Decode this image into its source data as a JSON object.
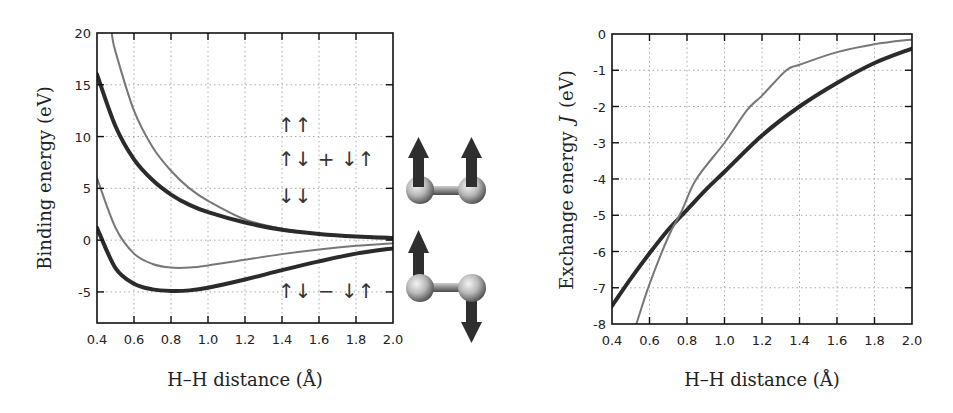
{
  "colors": {
    "thick_curve": "#2b2b2b",
    "thin_curve": "#777777",
    "grid": "#aaaaaa",
    "axis": "#111111",
    "arrow": "#2e2e2e",
    "atom": "#bdbdbd"
  },
  "chart_data": [
    {
      "type": "line",
      "title": "",
      "xlabel": "H–H distance (Å)",
      "ylabel": "Binding energy (eV)",
      "xlim": [
        0.4,
        2.0
      ],
      "ylim": [
        -8,
        20
      ],
      "grid": true,
      "x_ticks": [
        "0.4",
        "0.6",
        "0.8",
        "1.0",
        "1.2",
        "1.4",
        "1.6",
        "1.8",
        "2.0"
      ],
      "y_ticks": [
        "20",
        "15",
        "10",
        "5",
        "0",
        "-5"
      ],
      "annotations": [
        "↑↑",
        "↑↓ + ↓↑",
        "↓↓",
        "↑↓ − ↓↑"
      ],
      "series": [
        {
          "name": "triplet (thin)",
          "style": "thin",
          "x": [
            0.48,
            0.5,
            0.6,
            0.7,
            0.8,
            0.9,
            1.0,
            1.2,
            1.4,
            1.6,
            1.8,
            2.0
          ],
          "y": [
            20,
            18.2,
            12.5,
            9.0,
            6.7,
            5.0,
            3.8,
            2.0,
            1.1,
            0.6,
            0.4,
            0.3
          ]
        },
        {
          "name": "triplet (thick)",
          "style": "thick",
          "x": [
            0.4,
            0.5,
            0.6,
            0.7,
            0.8,
            0.9,
            1.0,
            1.2,
            1.4,
            1.6,
            1.8,
            2.0
          ],
          "y": [
            16,
            11,
            7.8,
            5.8,
            4.4,
            3.4,
            2.7,
            1.7,
            1.0,
            0.6,
            0.35,
            0.2
          ]
        },
        {
          "name": "singlet (thin)",
          "style": "thin",
          "x": [
            0.4,
            0.5,
            0.6,
            0.7,
            0.8,
            0.9,
            1.0,
            1.2,
            1.4,
            1.6,
            1.8,
            2.0
          ],
          "y": [
            6,
            1.2,
            -1.3,
            -2.3,
            -2.65,
            -2.65,
            -2.45,
            -1.9,
            -1.35,
            -0.9,
            -0.55,
            -0.3
          ]
        },
        {
          "name": "singlet (thick)",
          "style": "thick",
          "x": [
            0.4,
            0.5,
            0.6,
            0.7,
            0.8,
            0.9,
            1.0,
            1.2,
            1.4,
            1.6,
            1.8,
            2.0
          ],
          "y": [
            1.2,
            -2.7,
            -4.2,
            -4.75,
            -4.9,
            -4.85,
            -4.6,
            -3.8,
            -2.9,
            -2.05,
            -1.3,
            -0.8
          ]
        }
      ]
    },
    {
      "type": "line",
      "title": "",
      "xlabel": "H–H distance (Å)",
      "ylabel": "Exchange energy  J  (eV)",
      "xlim": [
        0.4,
        2.0
      ],
      "ylim": [
        -8,
        0
      ],
      "grid": true,
      "x_ticks": [
        "0.4",
        "0.6",
        "0.8",
        "1.0",
        "1.2",
        "1.4",
        "1.6",
        "1.8",
        "2.0"
      ],
      "y_ticks": [
        "0",
        "-1",
        "-2",
        "-3",
        "-4",
        "-5",
        "-6",
        "-7",
        "-8"
      ],
      "series": [
        {
          "name": "J (thick)",
          "style": "thick",
          "x": [
            0.4,
            0.5,
            0.6,
            0.7,
            0.8,
            0.9,
            1.0,
            1.2,
            1.4,
            1.6,
            1.8,
            2.0
          ],
          "y": [
            -7.5,
            -6.75,
            -6.05,
            -5.4,
            -4.85,
            -4.3,
            -3.8,
            -2.8,
            -2.0,
            -1.35,
            -0.8,
            -0.4
          ]
        },
        {
          "name": "J (thin)",
          "style": "thin",
          "x": [
            0.53,
            0.6,
            0.7,
            0.77,
            0.85,
            1.0,
            1.12,
            1.2,
            1.33,
            1.4,
            1.6,
            1.8,
            2.0
          ],
          "y": [
            -8,
            -6.9,
            -5.6,
            -4.9,
            -4.0,
            -3.0,
            -2.1,
            -1.7,
            -1.0,
            -0.85,
            -0.5,
            -0.28,
            -0.15
          ]
        }
      ]
    }
  ],
  "left_plot": {
    "ylabel": "Binding energy (eV)",
    "xlabel": "H–H distance (Å)",
    "spin_labels": {
      "up_up": "↑↑",
      "sym": "↑↓ + ↓↑",
      "down_down": "↓↓",
      "antisym": "↑↓ − ↓↑"
    }
  },
  "right_plot": {
    "ylabel": "Exchange energy",
    "ylabel_symbol": "J",
    "ylabel_unit": "(eV)",
    "xlabel": "H–H distance (Å)"
  },
  "molecules": [
    {
      "name": "parallel-spins",
      "spins": [
        "up",
        "up"
      ]
    },
    {
      "name": "antiparallel-spins",
      "spins": [
        "up",
        "down"
      ]
    }
  ]
}
